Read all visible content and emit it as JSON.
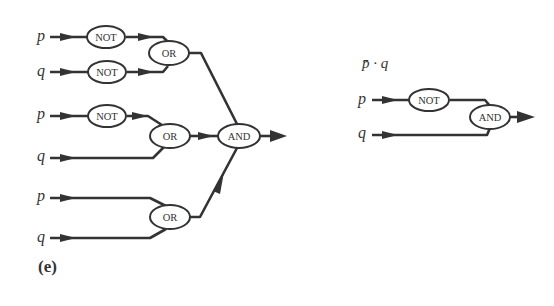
{
  "left_circuit": {
    "inputs": [
      "p",
      "q",
      "p",
      "q",
      "p",
      "q"
    ],
    "gates": {
      "not1": "NOT",
      "not2": "NOT",
      "or1": "OR",
      "not3": "NOT",
      "or2": "OR",
      "or3": "OR",
      "and1": "AND"
    },
    "caption": "(e)"
  },
  "right_circuit": {
    "expression": "p̄ · q",
    "inputs": [
      "p",
      "q"
    ],
    "gates": {
      "not1": "NOT",
      "and1": "AND"
    }
  }
}
